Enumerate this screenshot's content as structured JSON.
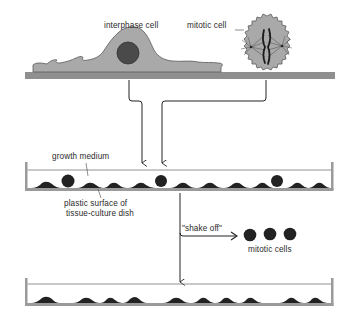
{
  "diagram": {
    "type": "process-flow",
    "topic": "mitotic shake-off in tissue culture",
    "colors": {
      "cell_fill": "#a9a9a9",
      "cell_outline": "#555555",
      "nucleus": "#4a4a4a",
      "plate": "#8f8f8f",
      "dark_cell": "#222222",
      "line": "#222222",
      "dish_wall": "#9a9a9a"
    },
    "top_panel": {
      "labels": {
        "interphase": "interphase cell",
        "mitotic": "mitotic cell"
      }
    },
    "middle_dish": {
      "labels": {
        "medium": "growth medium",
        "surface_line1": "plastic surface of",
        "surface_line2": "tissue-culture dish"
      },
      "cells": [
        {
          "kind": "flat"
        },
        {
          "kind": "round"
        },
        {
          "kind": "flat"
        },
        {
          "kind": "flat"
        },
        {
          "kind": "flat"
        },
        {
          "kind": "round"
        },
        {
          "kind": "flat"
        },
        {
          "kind": "flat"
        },
        {
          "kind": "flat"
        },
        {
          "kind": "flat"
        },
        {
          "kind": "round"
        },
        {
          "kind": "flat"
        },
        {
          "kind": "flat"
        }
      ]
    },
    "shake_off": {
      "label": "\"shake off\"",
      "result_label": "mitotic cells",
      "result_count": 3
    },
    "bottom_dish": {
      "cells": [
        {
          "kind": "flat"
        },
        {
          "kind": "flat"
        },
        {
          "kind": "flat"
        },
        {
          "kind": "flat"
        },
        {
          "kind": "flat"
        },
        {
          "kind": "flat"
        },
        {
          "kind": "flat"
        },
        {
          "kind": "flat"
        },
        {
          "kind": "flat"
        },
        {
          "kind": "flat"
        }
      ]
    }
  }
}
